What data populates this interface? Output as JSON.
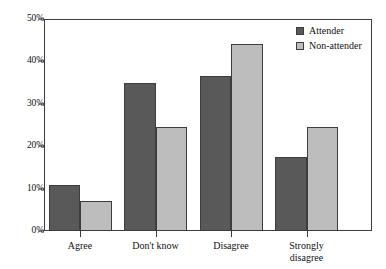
{
  "chart_data": {
    "type": "bar",
    "title": "",
    "xlabel": "",
    "ylabel": "",
    "categories": [
      "Agree",
      "Don't know",
      "Disagree",
      "Strongly\ndisagree"
    ],
    "series": [
      {
        "name": "Attender",
        "values": [
          10.8,
          35.0,
          36.6,
          17.5
        ],
        "color": "#595959"
      },
      {
        "name": "Non-attender",
        "values": [
          7.0,
          24.5,
          44.0,
          24.5
        ],
        "color": "#bdbdbd"
      }
    ],
    "ylim": [
      0,
      50
    ],
    "yticks": [
      0,
      10,
      20,
      30,
      40,
      50
    ],
    "ytick_labels": [
      "0%",
      "10%",
      "20%",
      "30%",
      "40%",
      "50%"
    ],
    "grid": false,
    "legend_position": "top-right",
    "value_unit": "%"
  },
  "legend": {
    "entries": [
      {
        "label": "Attender",
        "swatch": "dark-gray-swatch"
      },
      {
        "label": "Non-attender",
        "swatch": "light-gray-swatch"
      }
    ]
  },
  "caption_remnant": ""
}
